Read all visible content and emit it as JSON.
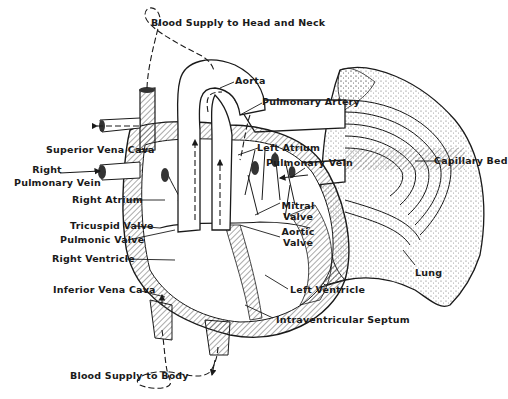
{
  "diagram": {
    "labels": {
      "blood_supply_head_neck": "Blood Supply to Head and Neck",
      "aorta": "Aorta",
      "pulmonary_artery": "Pulmonary Artery",
      "superior_vena_cava": "Superior Vena Cava",
      "left_atrium": "Left Atrium",
      "right_pulmonary_vein_1": "Right",
      "right_pulmonary_vein_2": "Pulmonary Vein",
      "pulmonary_vein": "Pulmonary Vein",
      "capillary_bed": "Capillary Bed",
      "right_atrium": "Right Atrium",
      "mitral_valve_1": "Mitral",
      "mitral_valve_2": "Valve",
      "tricuspid_valve": "Tricuspid Valve",
      "aortic_valve_1": "Aortic",
      "aortic_valve_2": "Valve",
      "pulmonic_valve": "Pulmonic Valve",
      "right_ventricle": "Right Ventricle",
      "lung": "Lung",
      "inferior_vena_cava": "Inferior Vena Cava",
      "left_ventricle": "Left Ventricle",
      "intraventricular_septum": "Intraventricular Septum",
      "blood_supply_body": "Blood Supply to Body"
    },
    "colors": {
      "ink": "#1a1a1a",
      "background": "#ffffff",
      "hatch": "#555555"
    }
  }
}
